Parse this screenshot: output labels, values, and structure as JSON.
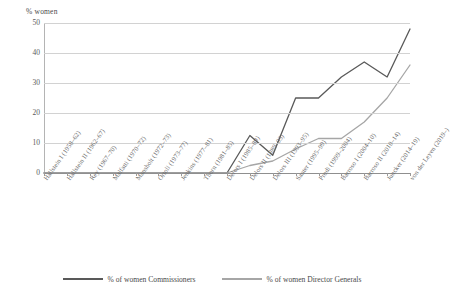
{
  "chart_data": {
    "type": "line",
    "title": "",
    "xlabel": "",
    "ylabel": "% women",
    "ylim": [
      0,
      50
    ],
    "yticks": [
      0,
      10,
      20,
      30,
      40,
      50
    ],
    "grid": true,
    "legend_position": "bottom",
    "categories": [
      "Hallstein I (1958–62)",
      "Hallstein II (1962–67)",
      "Rey (1967–70)",
      "Malfatti (1970–72)",
      "Mansholt (1972–73)",
      "Ortoli (1973–77)",
      "Jenkins (1977–81)",
      "Thorn (1981–85)",
      "Delors I (1985–89)",
      "Delors II (1989–93)",
      "Delors III (1993–95)",
      "Santer (1995–99)",
      "Prodi (1999–2004)",
      "Barroso I (2004–10)",
      "Barroso II (2010–14)",
      "Juncker (2014–19)",
      "von der Leyen (2019–)"
    ],
    "series": [
      {
        "name": "% of women Commissioners",
        "color": "#595959",
        "values": [
          0,
          0,
          0,
          0,
          0,
          0,
          0,
          0,
          0,
          12.5,
          5.9,
          25,
          25,
          32,
          37,
          32,
          48
        ]
      },
      {
        "name": "% of women Director Generals",
        "color": "#a6a6a6",
        "values": [
          0,
          0,
          0,
          0,
          0,
          0,
          0,
          0,
          0,
          2.5,
          4,
          8,
          11.5,
          11.5,
          17,
          25,
          36
        ]
      }
    ]
  },
  "axis": {
    "y_title": "% women",
    "y_tick_labels": [
      "50",
      "40",
      "30",
      "20",
      "10",
      "0"
    ]
  },
  "legend": {
    "items": [
      {
        "label": "% of women Commissioners",
        "color": "#595959"
      },
      {
        "label": "% of women Director Generals",
        "color": "#a6a6a6"
      }
    ]
  }
}
